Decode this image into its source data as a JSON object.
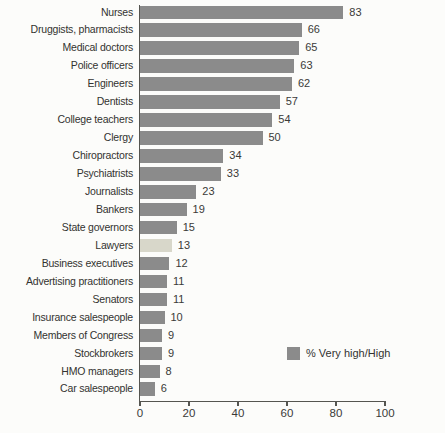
{
  "chart_data": {
    "type": "bar",
    "orientation": "horizontal",
    "title": "",
    "xlabel": "",
    "ylabel": "",
    "categories": [
      "Nurses",
      "Druggists, pharmacists",
      "Medical doctors",
      "Police officers",
      "Engineers",
      "Dentists",
      "College teachers",
      "Clergy",
      "Chiropractors",
      "Psychiatrists",
      "Journalists",
      "Bankers",
      "State governors",
      "Lawyers",
      "Business executives",
      "Advertising practitioners",
      "Senators",
      "Insurance salespeople",
      "Members of Congress",
      "Stockbrokers",
      "HMO managers",
      "Car salespeople"
    ],
    "values": [
      83,
      66,
      65,
      63,
      62,
      57,
      54,
      50,
      34,
      33,
      23,
      19,
      15,
      13,
      12,
      11,
      11,
      10,
      9,
      9,
      8,
      6
    ],
    "data_labels_shown": true,
    "highlight_category": "Lawyers",
    "highlight_index": 13,
    "xlim": [
      0,
      100
    ],
    "x_ticks": [
      "0",
      "20",
      "40",
      "60",
      "80",
      "100"
    ],
    "x_tick_values": [
      0,
      20,
      40,
      60,
      80,
      100
    ],
    "grid": false,
    "legend": {
      "label": "% Very high/High",
      "position": "right-middle"
    },
    "colors": {
      "bar": "#8b8b8b",
      "highlight_bar": "#d8d7ca",
      "axis": "#555550",
      "text": "#333330",
      "background": "#fcfcfa"
    }
  }
}
